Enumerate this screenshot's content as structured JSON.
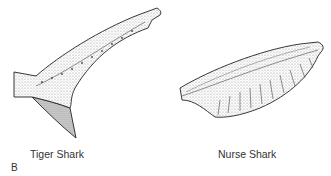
{
  "figure": {
    "panel_label": "B",
    "illustrations": [
      {
        "name": "Tiger Shark",
        "description": "stippled heterocercal caudal fin, upper lobe long and upturned with notch near tip, short lower lobe"
      },
      {
        "name": "Nurse Shark",
        "description": "stippled caudal fin, elongated nearly horizontal with ribbed/scalloped lower margin, no distinct lower lobe"
      }
    ],
    "labels": {
      "tiger": "Tiger Shark",
      "nurse": "Nurse Shark"
    },
    "colors": {
      "ink": "#222222",
      "stipple": "#9a9a9a",
      "background": "#ffffff"
    }
  }
}
